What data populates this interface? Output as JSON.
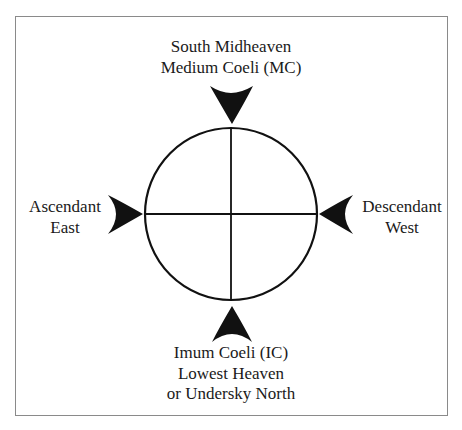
{
  "diagram": {
    "type": "astrological-chart-angles",
    "frame_color": "#8a8a8a",
    "ink_color": "#111111",
    "circle": {
      "cx": 231,
      "cy": 214,
      "r": 86
    },
    "points": {
      "top": {
        "lines": [
          "South Midheaven",
          "Medium Coeli (MC)"
        ],
        "arrow_direction": "down"
      },
      "bottom": {
        "lines": [
          "Imum Coeli (IC)",
          "Lowest Heaven",
          "or Undersky North"
        ],
        "arrow_direction": "up"
      },
      "left": {
        "lines": [
          "Ascendant",
          "East"
        ],
        "arrow_direction": "right"
      },
      "right": {
        "lines": [
          "Descendant",
          "West"
        ],
        "arrow_direction": "left"
      }
    }
  }
}
